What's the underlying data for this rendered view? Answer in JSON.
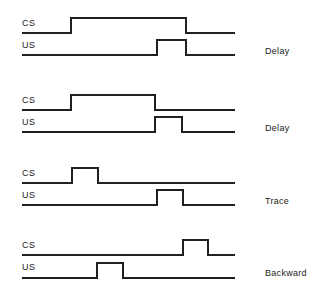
{
  "figure": {
    "type": "diagram",
    "background_color": "#ffffff",
    "line_color": "#231f20"
  },
  "geometry": {
    "width": 319,
    "height": 300,
    "trace_start_x": 22,
    "trace_end_x": 235,
    "pulse_amplitude": 15
  },
  "blocks": [
    {
      "id": "delay-1",
      "paradigm_label": "Delay",
      "paradigm_x": 265,
      "paradigm_y": 47,
      "cs": {
        "label": "CS",
        "label_x": 22,
        "label_y": 19,
        "baseline_y": 33,
        "pulse_start_x": 71,
        "pulse_end_x": 186
      },
      "us": {
        "label": "US",
        "label_x": 22,
        "label_y": 41,
        "baseline_y": 55,
        "pulse_start_x": 157,
        "pulse_end_x": 186
      }
    },
    {
      "id": "delay-2",
      "paradigm_label": "Delay",
      "paradigm_x": 265,
      "paradigm_y": 124,
      "cs": {
        "label": "CS",
        "label_x": 22,
        "label_y": 96,
        "baseline_y": 110,
        "pulse_start_x": 71,
        "pulse_end_x": 155
      },
      "us": {
        "label": "US",
        "label_x": 22,
        "label_y": 118,
        "baseline_y": 132,
        "pulse_start_x": 155,
        "pulse_end_x": 182
      }
    },
    {
      "id": "trace",
      "paradigm_label": "Trace",
      "paradigm_x": 265,
      "paradigm_y": 197,
      "cs": {
        "label": "CS",
        "label_x": 22,
        "label_y": 169,
        "baseline_y": 183,
        "pulse_start_x": 72,
        "pulse_end_x": 98
      },
      "us": {
        "label": "US",
        "label_x": 22,
        "label_y": 191,
        "baseline_y": 205,
        "pulse_start_x": 157,
        "pulse_end_x": 183
      }
    },
    {
      "id": "backward",
      "paradigm_label": "Backward",
      "paradigm_x": 265,
      "paradigm_y": 269,
      "cs": {
        "label": "CS",
        "label_x": 22,
        "label_y": 241,
        "baseline_y": 255,
        "pulse_start_x": 183,
        "pulse_end_x": 208
      },
      "us": {
        "label": "US",
        "label_x": 22,
        "label_y": 263,
        "baseline_y": 278,
        "pulse_start_x": 97,
        "pulse_end_x": 123
      }
    }
  ]
}
